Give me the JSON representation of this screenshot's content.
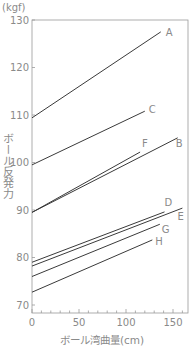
{
  "chart_data": {
    "type": "line",
    "title": "",
    "xlabel": "ボール湾曲量(cm)",
    "ylabel": "ボール反発力",
    "y_unit": "(kgf)",
    "xlim": [
      0,
      165
    ],
    "ylim": [
      70,
      130
    ],
    "x_ticks": [
      0,
      50,
      100,
      150
    ],
    "y_ticks": [
      70,
      80,
      90,
      100,
      110,
      120,
      130
    ],
    "x_minor_step": 10,
    "grid": false,
    "legend": "inline labels at line ends",
    "series": [
      {
        "name": "A",
        "x": [
          0,
          137
        ],
        "y": [
          109.4,
          127.5
        ]
      },
      {
        "name": "C",
        "x": [
          0,
          120
        ],
        "y": [
          99.5,
          110.8
        ]
      },
      {
        "name": "F",
        "x": [
          0,
          115
        ],
        "y": [
          89.5,
          102.2
        ]
      },
      {
        "name": "B",
        "x": [
          0,
          155
        ],
        "y": [
          89.5,
          105.2
        ]
      },
      {
        "name": "D",
        "x": [
          0,
          141
        ],
        "y": [
          79.0,
          89.6
        ]
      },
      {
        "name": "E",
        "x": [
          0,
          160
        ],
        "y": [
          78.2,
          90.4
        ]
      },
      {
        "name": "G",
        "x": [
          0,
          136
        ],
        "y": [
          76.0,
          87.0
        ]
      },
      {
        "name": "H",
        "x": [
          0,
          128
        ],
        "y": [
          72.7,
          83.7
        ]
      }
    ]
  },
  "labels": {
    "unit": "(kgf)",
    "ylabel": "ボール反発力",
    "xlabel": "ボール湾曲量(cm)"
  },
  "colors": {
    "line": "#3a3a3a",
    "axis": "#9a9a9a",
    "text": "#8a8a8a"
  }
}
